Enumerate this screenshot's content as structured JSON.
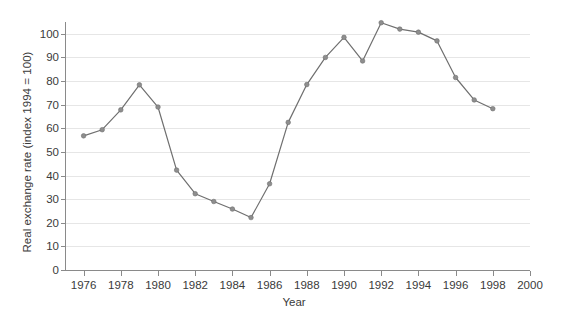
{
  "chart_data": {
    "type": "line",
    "title": "",
    "xlabel": "Year",
    "ylabel": "Real exchange rate (index 1994 = 100)",
    "xlim": [
      1975,
      2000
    ],
    "ylim": [
      0,
      105
    ],
    "grid": true,
    "legend": null,
    "legend_position": "none",
    "series_color": "#7a7a7a",
    "marker": "circle",
    "x_ticks": [
      1976,
      1978,
      1980,
      1982,
      1984,
      1986,
      1988,
      1990,
      1992,
      1994,
      1996,
      1998,
      2000
    ],
    "x_tick_labels": [
      "1976",
      "1978",
      "1980",
      "1982",
      "1984",
      "1986",
      "1988",
      "1990",
      "1992",
      "1994",
      "1996",
      "1998",
      "2000"
    ],
    "y_ticks": [
      0,
      10,
      20,
      30,
      40,
      50,
      60,
      70,
      80,
      90,
      100
    ],
    "y_tick_labels": [
      "0",
      "10",
      "20",
      "30",
      "40",
      "50",
      "60",
      "70",
      "80",
      "90",
      "100"
    ],
    "x": [
      1976,
      1977,
      1978,
      1979,
      1980,
      1981,
      1982,
      1983,
      1984,
      1985,
      1986,
      1987,
      1988,
      1989,
      1990,
      1991,
      1992,
      1993,
      1994,
      1995,
      1996,
      1997,
      1998
    ],
    "values": [
      56.8,
      59.4,
      67.8,
      78.4,
      69.0,
      42.3,
      32.3,
      29.0,
      25.8,
      22.2,
      36.5,
      62.5,
      78.5,
      90.0,
      98.5,
      88.5,
      104.7,
      102.0,
      100.7,
      97.0,
      81.5,
      72.0,
      68.3
    ],
    "series": [
      {
        "name": "Real exchange rate",
        "values": [
          56.8,
          59.4,
          67.8,
          78.4,
          69.0,
          42.3,
          32.3,
          29.0,
          25.8,
          22.2,
          36.5,
          62.5,
          78.5,
          90.0,
          98.5,
          88.5,
          104.7,
          102.0,
          100.7,
          97.0,
          81.5,
          72.0,
          68.3
        ]
      }
    ]
  }
}
